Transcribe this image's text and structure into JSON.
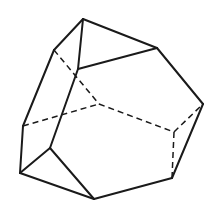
{
  "diagram": {
    "title": "",
    "type": "polyhedron-line-drawing",
    "stroke_color": "#1a1a1a",
    "background": "#ffffff",
    "vertices": {
      "A": [
        83,
        19
      ],
      "B": [
        157,
        48
      ],
      "C": [
        54,
        50
      ],
      "D": [
        78,
        69
      ],
      "E": [
        203,
        104
      ],
      "F": [
        99,
        104
      ],
      "G": [
        174,
        132
      ],
      "H": [
        23,
        126
      ],
      "I": [
        50,
        148
      ],
      "J": [
        20,
        173
      ],
      "K": [
        94,
        199
      ],
      "L": [
        172,
        178
      ]
    },
    "solid_edges": [
      [
        "A",
        "B"
      ],
      [
        "A",
        "C"
      ],
      [
        "A",
        "D"
      ],
      [
        "D",
        "B"
      ],
      [
        "B",
        "E"
      ],
      [
        "C",
        "H"
      ],
      [
        "D",
        "I"
      ],
      [
        "H",
        "J"
      ],
      [
        "J",
        "I"
      ],
      [
        "I",
        "K"
      ],
      [
        "J",
        "K"
      ],
      [
        "K",
        "L"
      ],
      [
        "L",
        "E"
      ]
    ],
    "hidden_edges": [
      [
        "C",
        "F"
      ],
      [
        "H",
        "F"
      ],
      [
        "F",
        "G"
      ],
      [
        "G",
        "E"
      ],
      [
        "G",
        "L"
      ]
    ]
  }
}
